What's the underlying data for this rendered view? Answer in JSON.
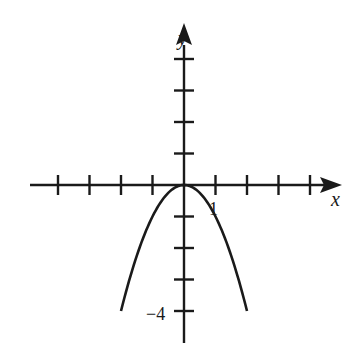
{
  "chart_data": {
    "type": "line",
    "title": "",
    "function": "y = -x^2",
    "xlabel": "x",
    "ylabel": "y",
    "xlim": [
      -5,
      5
    ],
    "ylim": [
      -5,
      5
    ],
    "grid": false,
    "x_ticks": [
      -4,
      -3,
      -2,
      -1,
      1,
      2,
      3,
      4
    ],
    "y_ticks": [
      4,
      3,
      2,
      1,
      -1,
      -2,
      -3,
      -4
    ],
    "tick_labels": [
      {
        "axis": "x",
        "value": 1,
        "text": "1"
      },
      {
        "axis": "y",
        "value": -4,
        "text": "−4"
      }
    ],
    "series": [
      {
        "name": "parabola",
        "x": [
          -2,
          -1.5,
          -1,
          -0.5,
          0,
          0.5,
          1,
          1.5,
          2
        ],
        "y": [
          -4,
          -2.25,
          -1,
          -0.25,
          0,
          -0.25,
          -1,
          -2.25,
          -4
        ]
      }
    ]
  },
  "labels": {
    "x_axis": "x",
    "y_axis": "y",
    "x_tick_one": "1",
    "y_tick_neg_four": "−4"
  },
  "colors": {
    "ink": "#1a1a1a",
    "background": "#ffffff"
  }
}
